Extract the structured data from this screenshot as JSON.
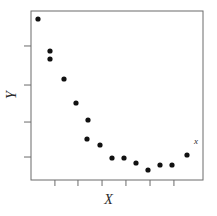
{
  "chart_data": {
    "type": "scatter",
    "title": "",
    "xlabel": "X",
    "ylabel": "Y",
    "grid": false,
    "legend": null,
    "xlim": [
      0,
      1
    ],
    "ylim": [
      0,
      1
    ],
    "x_ticks": [
      0.139,
      0.273,
      0.413,
      0.552,
      0.692,
      0.831
    ],
    "y_ticks": [
      0.793,
      0.562,
      0.343,
      0.136
    ],
    "x_tick_labels": [
      "",
      "",
      "",
      "",
      "",
      ""
    ],
    "y_tick_labels": [
      "",
      "",
      "",
      ""
    ],
    "series": [
      {
        "name": "data",
        "marker": "filled-circle",
        "color": "#111111",
        "points": [
          {
            "px": 38,
            "py": 19
          },
          {
            "px": 50,
            "py": 51
          },
          {
            "px": 50,
            "py": 59
          },
          {
            "px": 64,
            "py": 79
          },
          {
            "px": 76,
            "py": 103
          },
          {
            "px": 88,
            "py": 120
          },
          {
            "px": 87,
            "py": 139
          },
          {
            "px": 100,
            "py": 145
          },
          {
            "px": 112,
            "py": 158
          },
          {
            "px": 124,
            "py": 158
          },
          {
            "px": 136,
            "py": 163
          },
          {
            "px": 148,
            "py": 170
          },
          {
            "px": 160,
            "py": 165
          },
          {
            "px": 172,
            "py": 165
          },
          {
            "px": 187,
            "py": 155
          }
        ]
      }
    ],
    "annotations": [
      {
        "text": "x",
        "px": 196,
        "py": 144,
        "style": "serif-italic-small"
      }
    ]
  },
  "axes": {
    "frame": {
      "left": 31,
      "top": 11,
      "right": 203,
      "bottom": 180
    },
    "line_color": "#6b6b6b",
    "line_width": 1
  },
  "labels": {
    "x_title": "X",
    "y_title": "Y",
    "corner_marker": "x"
  }
}
